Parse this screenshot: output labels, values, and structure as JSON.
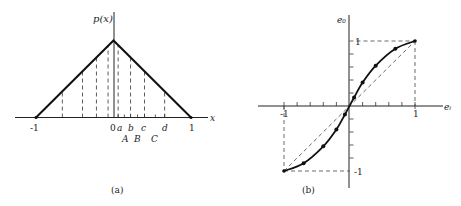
{
  "panel_a": {
    "caption": "(a)",
    "y_axis_label": "p(x)",
    "x_axis_label": "x",
    "tick_labels": {
      "neg_one": "-1",
      "zero": "0",
      "one": "1"
    },
    "threshold_labels": [
      "a",
      "b",
      "c",
      "d"
    ],
    "level_labels": [
      "A",
      "B",
      "C"
    ],
    "function": "triangular density, peak at x=0, zero at x=-1 and x=1",
    "left_dashed_x": [
      -0.66,
      -0.4,
      -0.22,
      -0.07
    ],
    "right_dashed_x": [
      0.06,
      0.22,
      0.4,
      0.66
    ],
    "threshold_x": [
      0.06,
      0.22,
      0.4,
      0.66
    ],
    "level_x": [
      0.14,
      0.31,
      0.54
    ]
  },
  "panel_b": {
    "caption": "(b)",
    "y_axis_label": "e₀",
    "x_axis_label": "eᵢ",
    "tick_labels": {
      "x_neg_one": "-1",
      "x_one": "1",
      "y_one": "1",
      "y_neg_one": "-1"
    },
    "curve_points": [
      [
        -1,
        -1
      ],
      [
        -0.7,
        -0.88
      ],
      [
        -0.4,
        -0.62
      ],
      [
        -0.2,
        -0.36
      ],
      [
        -0.07,
        -0.13
      ],
      [
        0,
        0
      ],
      [
        0.07,
        0.13
      ],
      [
        0.2,
        0.36
      ],
      [
        0.4,
        0.62
      ],
      [
        0.7,
        0.88
      ],
      [
        1,
        1
      ]
    ],
    "dot_points": [
      [
        -0.7,
        -0.88
      ],
      [
        -0.4,
        -0.62
      ],
      [
        -0.2,
        -0.36
      ],
      [
        -0.07,
        -0.13
      ],
      [
        0.07,
        0.13
      ],
      [
        0.2,
        0.36
      ],
      [
        0.4,
        0.62
      ],
      [
        0.7,
        0.88
      ]
    ],
    "x_ticks": [
      -0.8,
      -0.6,
      -0.4,
      -0.2,
      0.2,
      0.4,
      0.6,
      0.8
    ],
    "y_ticks": [
      -0.8,
      -0.6,
      -0.4,
      -0.2,
      0.2,
      0.4,
      0.6,
      0.8
    ]
  }
}
